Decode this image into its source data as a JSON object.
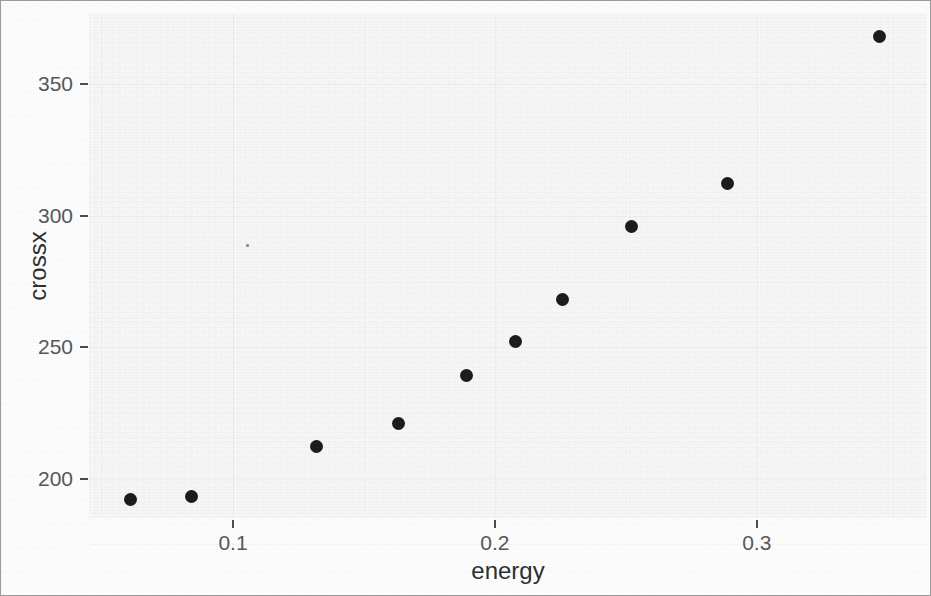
{
  "figure": {
    "background_color": "#fdfdfd",
    "panel_color": "#f7f7f7",
    "border_color": "#9a9a9a",
    "point_color": "#1a1a1a",
    "axis_text_color": "#555759",
    "axis_title_color": "#2e2e2e"
  },
  "chart_data": {
    "type": "scatter",
    "title": "",
    "subtitle": "",
    "xlabel": "energy",
    "ylabel": "crossx",
    "xlim": [
      0.045,
      0.365
    ],
    "ylim": [
      185,
      377
    ],
    "xticks": [
      0.1,
      0.2,
      0.3
    ],
    "xtick_labels": [
      "0.1",
      "0.2",
      "0.3"
    ],
    "yticks": [
      200,
      250,
      300,
      350
    ],
    "ytick_labels": [
      "200",
      "250",
      "300",
      "350"
    ],
    "grid": true,
    "legend": null,
    "legend_position": "none",
    "x": [
      0.061,
      0.084,
      0.132,
      0.163,
      0.189,
      0.208,
      0.226,
      0.252,
      0.289,
      0.347
    ],
    "y": [
      192,
      193,
      212,
      221,
      239,
      252,
      268,
      296,
      312,
      368
    ],
    "points": [
      {
        "energy": 0.061,
        "crossx": 192
      },
      {
        "energy": 0.084,
        "crossx": 193
      },
      {
        "energy": 0.132,
        "crossx": 212
      },
      {
        "energy": 0.163,
        "crossx": 221
      },
      {
        "energy": 0.189,
        "crossx": 239
      },
      {
        "energy": 0.208,
        "crossx": 252
      },
      {
        "energy": 0.226,
        "crossx": 268
      },
      {
        "energy": 0.252,
        "crossx": 296
      },
      {
        "energy": 0.289,
        "crossx": 312
      },
      {
        "energy": 0.347,
        "crossx": 368
      }
    ],
    "marker": "filled-circle",
    "marker_size_px": 13,
    "n_points": 10
  }
}
